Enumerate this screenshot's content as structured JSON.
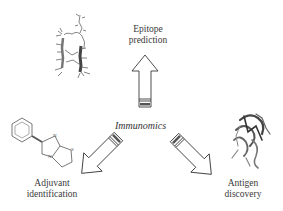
{
  "diagram": {
    "center": {
      "label": "Immunomics"
    },
    "nodes": [
      {
        "id": "epitope",
        "line1": "Epitope",
        "line2": "prediction",
        "direction": "up",
        "image": "peptide-hairpin-structure"
      },
      {
        "id": "adjuvant",
        "line1": "Adjuvant",
        "line2": "identification",
        "direction": "down-left",
        "image": "levamisole-chemical-structure"
      },
      {
        "id": "antigen",
        "line1": "Antigen",
        "line2": "discovery",
        "direction": "down-right",
        "image": "protein-ribbon-structure"
      }
    ],
    "molecule_atoms": {
      "n1": "N",
      "n2": "N",
      "s": "S"
    },
    "colors": {
      "stroke": "#3a3a3a",
      "fill": "#ffffff",
      "molecule": "#555555"
    }
  }
}
